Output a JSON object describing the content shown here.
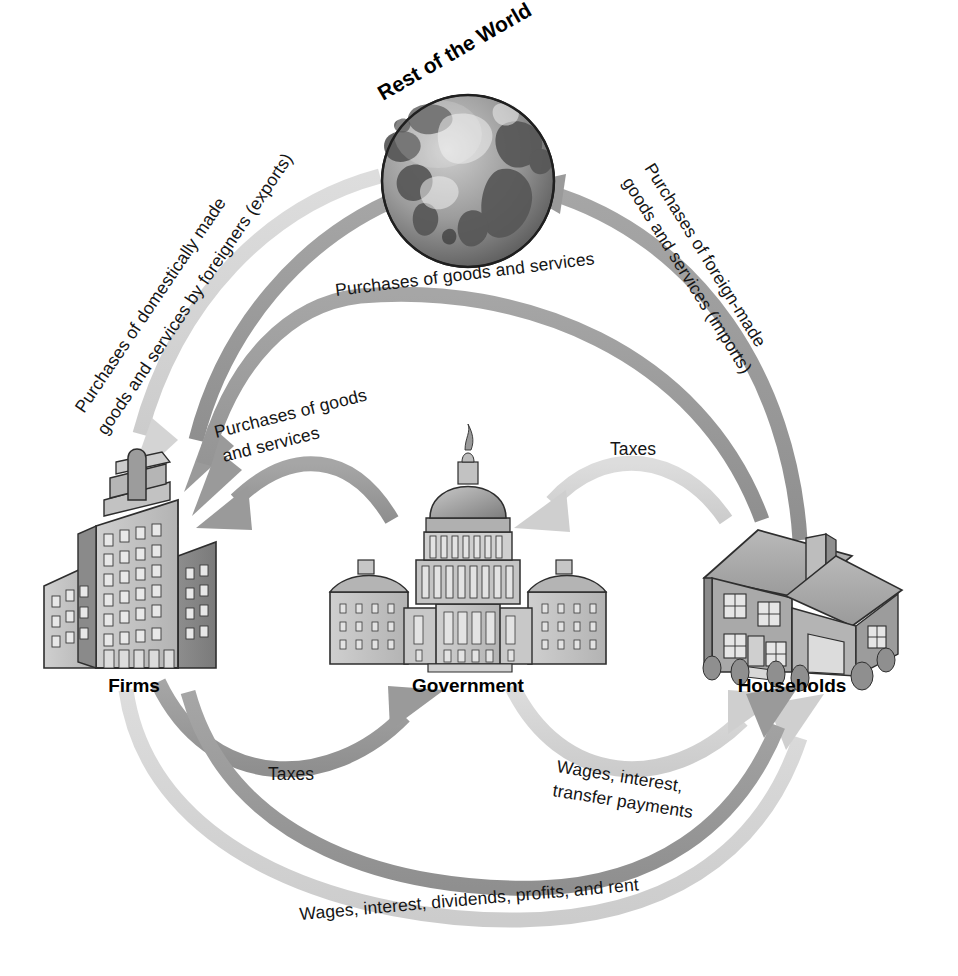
{
  "diagram": {
    "type": "circular-flow-economic-diagram",
    "background_color": "#ffffff",
    "arrow_color_dark": "#9a9a9a",
    "arrow_color_light": "#d6d6d6",
    "text_color": "#151515"
  },
  "entities": [
    {
      "id": "rest-of-world",
      "label": "Rest of the World",
      "icon": "globe-icon"
    },
    {
      "id": "firms",
      "label": "Firms",
      "icon": "office-building-icon"
    },
    {
      "id": "government",
      "label": "Government",
      "icon": "capitol-building-icon"
    },
    {
      "id": "households",
      "label": "Households",
      "icon": "house-icon"
    }
  ],
  "flows": [
    {
      "id": "exports",
      "label_lines": [
        "Purchases of domestically made",
        "goods and services by foreigners (exports)"
      ],
      "from": "rest-of-world",
      "to": "firms"
    },
    {
      "id": "imports",
      "label_lines": [
        "Purchases of foreign-made",
        "goods and services (imports)"
      ],
      "from": "households",
      "to": "rest-of-world"
    },
    {
      "id": "household-purchases",
      "label_lines": [
        "Purchases of goods and services"
      ],
      "from": "households",
      "to": "firms"
    },
    {
      "id": "government-purchases",
      "label_lines": [
        "Purchases of goods",
        "and services"
      ],
      "from": "government",
      "to": "firms"
    },
    {
      "id": "household-taxes",
      "label_lines": [
        "Taxes"
      ],
      "from": "households",
      "to": "government"
    },
    {
      "id": "firm-taxes",
      "label_lines": [
        "Taxes"
      ],
      "from": "firms",
      "to": "government"
    },
    {
      "id": "government-transfers",
      "label_lines": [
        "Wages, interest,",
        "transfer payments"
      ],
      "from": "government",
      "to": "households"
    },
    {
      "id": "factor-payments",
      "label_lines": [
        "Wages, interest, dividends, profits, and rent"
      ],
      "from": "firms",
      "to": "households"
    }
  ],
  "labels": {
    "rest_of_the_world": "Rest of the World",
    "firms": "Firms",
    "government": "Government",
    "households": "Households",
    "exports_l1": "Purchases of domestically made",
    "exports_l2": "goods and services by foreigners (exports)",
    "imports_l1": "Purchases of foreign-made",
    "imports_l2": "goods and services (imports)",
    "purchases_goods_services": "Purchases of goods and services",
    "gov_purchases_l1": "Purchases of goods",
    "gov_purchases_l2": "and services",
    "taxes_right": "Taxes",
    "taxes_left": "Taxes",
    "transfers_l1": "Wages, interest,",
    "transfers_l2": "transfer payments",
    "factor_payments": "Wages, interest, dividends, profits, and rent"
  }
}
